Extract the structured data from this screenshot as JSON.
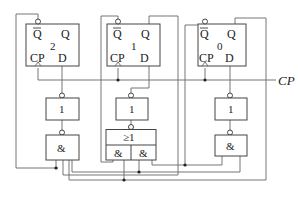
{
  "diagram": {
    "type": "digital-logic-circuit",
    "clock_label": "CP",
    "flip_flops": [
      {
        "index_label": "2",
        "qbar": "Q",
        "q": "Q",
        "cp": "CP",
        "d": "D"
      },
      {
        "index_label": "1",
        "qbar": "Q",
        "q": "Q",
        "cp": "CP",
        "d": "D"
      },
      {
        "index_label": "0",
        "qbar": "Q",
        "q": "Q",
        "cp": "CP",
        "d": "D"
      }
    ],
    "not_gates": [
      {
        "label": "1"
      },
      {
        "label": "1"
      },
      {
        "label": "1"
      }
    ],
    "and_gates": [
      {
        "label": "&"
      },
      {
        "label": "&"
      }
    ],
    "and_or_gate": {
      "or_label": "≥1",
      "and_labels": [
        "&",
        "&"
      ]
    }
  }
}
